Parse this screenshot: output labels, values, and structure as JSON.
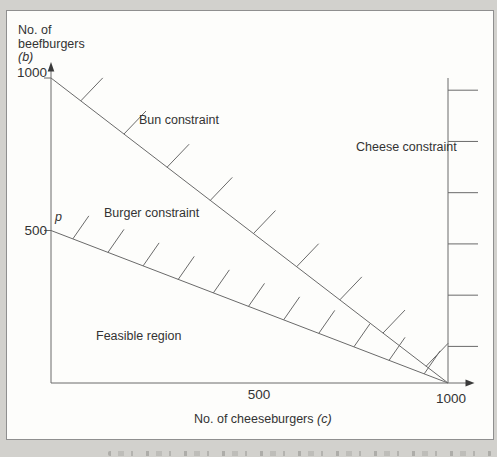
{
  "chart_data": {
    "type": "line",
    "xlabel": "No. of cheeseburgers (c)",
    "ylabel": "No. of beefburgers (b)",
    "ylabel_lines": [
      "No. of",
      "beefburgers"
    ],
    "ylabel_var": "(b)",
    "xlabel_text": "No. of cheeseburgers",
    "xlabel_var": "(c)",
    "xlim": [
      0,
      1060
    ],
    "ylim": [
      0,
      1050
    ],
    "x_ticks": [
      500,
      1000
    ],
    "y_ticks": [
      500,
      1000
    ],
    "grid": false,
    "series": [
      {
        "name": "Bun constraint",
        "points": [
          [
            0,
            1000
          ],
          [
            1000,
            0
          ]
        ],
        "infeasible_side": "above",
        "hatch_count": 9,
        "hatch_span": [
          0.075,
          0.945
        ],
        "hatch_offset": [
          22,
          -23
        ]
      },
      {
        "name": "Burger constraint",
        "points": [
          [
            0,
            500
          ],
          [
            1000,
            0
          ]
        ],
        "infeasible_side": "above",
        "hatch_count": 11,
        "hatch_span": [
          0.055,
          0.94
        ],
        "hatch_offset": [
          16,
          -23
        ]
      },
      {
        "name": "Cheese constraint",
        "points": [
          [
            1000,
            1000
          ],
          [
            1000,
            0
          ]
        ],
        "infeasible_side": "right",
        "hatch_count": 6,
        "hatch_span": [
          0.04,
          0.88
        ],
        "hatch_offset": [
          30,
          0
        ]
      }
    ],
    "annotations": [
      {
        "text": "p",
        "xy": [
          0,
          500
        ]
      },
      {
        "text": "Feasible region",
        "xy": [
          170,
          140
        ]
      }
    ],
    "colors": {
      "line": "#6a6a6a",
      "arrow": "#3a3a3a",
      "text": "#333333",
      "panel_bg": "#fdfdfb",
      "panel_border": "#8f8f8f",
      "page_bg": "#d2d1cd"
    }
  }
}
